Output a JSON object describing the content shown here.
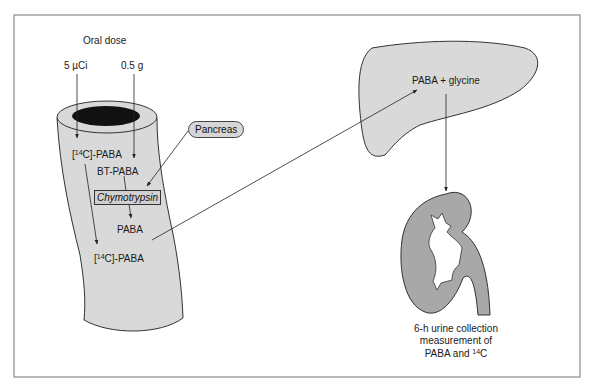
{
  "diagram": {
    "title_top": "Oral dose",
    "dose_radio": "5 µCi",
    "dose_bt": "0.5 g",
    "gut": {
      "label_c14_paba_top_pre": "[",
      "label_c14_paba_top_sup": "14",
      "label_c14_paba_top_post": "C]-PABA",
      "label_bt_paba": "BT-PABA",
      "label_enzyme": "Chymotrypsin",
      "label_paba": "PABA",
      "label_c14_paba_bottom_pre": "[",
      "label_c14_paba_bottom_sup": "14",
      "label_c14_paba_bottom_post": "C]-PABA"
    },
    "pancreas_label": "Pancreas",
    "liver_label": "PABA + glycine",
    "kidney": {
      "line1": "6-h urine collection",
      "line2": "measurement of",
      "line3_pre": "PABA and ",
      "line3_sup": "14",
      "line3_post": "C"
    },
    "colors": {
      "frame": "#888888",
      "organ_fill_light": "#d9d9d9",
      "kidney_fill": "#a8a8a8",
      "lumen": "#111111",
      "stroke": "#333333"
    }
  }
}
